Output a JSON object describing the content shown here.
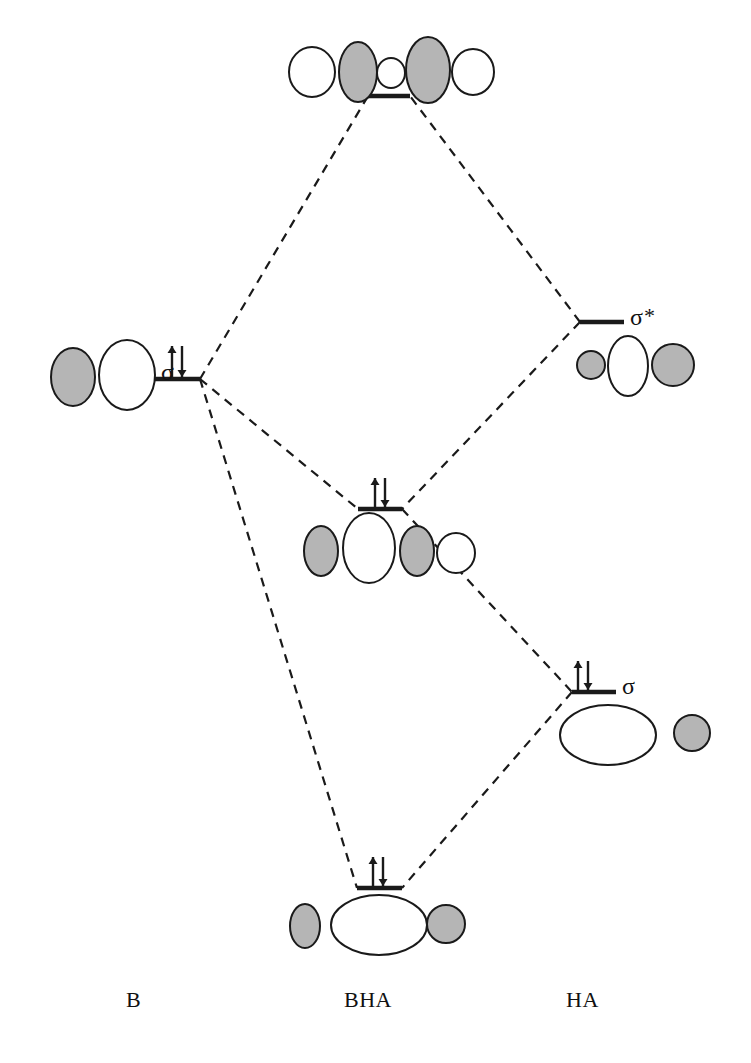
{
  "figure": {
    "kind": "molecular-orbital-correlation-diagram",
    "background_color": "#ffffff",
    "line_color": "#1a1a1a",
    "lobe_fill_shaded": "#b5b5b5",
    "lobe_fill_empty": "#ffffff",
    "width": 751,
    "height": 1063
  },
  "column_labels": {
    "left": "B",
    "center": "BHA",
    "right": "HA"
  },
  "orbital_labels": {
    "left_sigma": "σ",
    "right_sigma_star": "σ",
    "right_sigma_star_superscript": "*",
    "right_sigma": "σ"
  },
  "electron_arrow": {
    "up_glyph": "↑",
    "down_glyph": "↓",
    "pair_glyph": "⇅"
  },
  "levels": [
    {
      "id": "bha-antibonding",
      "column": "center",
      "label": "",
      "electrons": 0,
      "energy_y": 96,
      "bar_x1": 368,
      "bar_x2": 410,
      "orbital_set": "antibonding-top"
    },
    {
      "id": "ha-sigma-star",
      "column": "right",
      "label": "σ*",
      "electrons": 0,
      "energy_y": 322,
      "bar_x1": 580,
      "bar_x2": 624,
      "orbital_set": "sigma-star-right"
    },
    {
      "id": "b-sigma",
      "column": "left",
      "label": "σ",
      "electrons": 2,
      "energy_y": 379,
      "bar_x1": 152,
      "bar_x2": 200,
      "orbital_set": "sigma-left"
    },
    {
      "id": "bha-nonbonding",
      "column": "center",
      "label": "",
      "electrons": 2,
      "energy_y": 509,
      "bar_x1": 358,
      "bar_x2": 402,
      "orbital_set": "nonbonding-middle"
    },
    {
      "id": "ha-sigma",
      "column": "right",
      "label": "σ",
      "electrons": 2,
      "energy_y": 692,
      "bar_x1": 572,
      "bar_x2": 616,
      "orbital_set": "sigma-right"
    },
    {
      "id": "bha-bonding",
      "column": "center",
      "label": "",
      "electrons": 2,
      "energy_y": 888,
      "bar_x1": 357,
      "bar_x2": 402,
      "orbital_set": "bonding-bottom"
    }
  ],
  "correlation_lines": [
    {
      "from": "b-sigma",
      "to": "bha-antibonding"
    },
    {
      "from": "ha-sigma-star",
      "to": "bha-antibonding"
    },
    {
      "from": "b-sigma",
      "to": "bha-nonbonding"
    },
    {
      "from": "ha-sigma-star",
      "to": "bha-nonbonding"
    },
    {
      "from": "b-sigma",
      "to": "bha-bonding"
    },
    {
      "from": "ha-sigma",
      "to": "bha-bonding"
    },
    {
      "from": "bha-nonbonding",
      "to": "ha-sigma"
    }
  ],
  "orbital_sets": {
    "antibonding-top": [
      {
        "shape": "ellipse",
        "cx": 312,
        "cy": 72,
        "rx": 23,
        "ry": 25,
        "fill": "empty"
      },
      {
        "shape": "ellipse",
        "cx": 358,
        "cy": 72,
        "rx": 19,
        "ry": 30,
        "fill": "shaded"
      },
      {
        "shape": "ellipse",
        "cx": 391,
        "cy": 73,
        "rx": 14,
        "ry": 15,
        "fill": "empty"
      },
      {
        "shape": "ellipse",
        "cx": 428,
        "cy": 70,
        "rx": 22,
        "ry": 33,
        "fill": "shaded"
      },
      {
        "shape": "ellipse",
        "cx": 473,
        "cy": 72,
        "rx": 21,
        "ry": 23,
        "fill": "empty"
      }
    ],
    "sigma-star-right": [
      {
        "shape": "ellipse",
        "cx": 591,
        "cy": 365,
        "rx": 14,
        "ry": 14,
        "fill": "shaded"
      },
      {
        "shape": "ellipse",
        "cx": 628,
        "cy": 366,
        "rx": 20,
        "ry": 30,
        "fill": "empty"
      },
      {
        "shape": "ellipse",
        "cx": 673,
        "cy": 365,
        "rx": 21,
        "ry": 21,
        "fill": "shaded"
      }
    ],
    "sigma-left": [
      {
        "shape": "ellipse",
        "cx": 73,
        "cy": 377,
        "rx": 22,
        "ry": 29,
        "fill": "shaded"
      },
      {
        "shape": "ellipse",
        "cx": 127,
        "cy": 375,
        "rx": 28,
        "ry": 35,
        "fill": "empty"
      }
    ],
    "nonbonding-middle": [
      {
        "shape": "ellipse",
        "cx": 321,
        "cy": 551,
        "rx": 17,
        "ry": 25,
        "fill": "shaded"
      },
      {
        "shape": "ellipse",
        "cx": 369,
        "cy": 548,
        "rx": 26,
        "ry": 35,
        "fill": "empty"
      },
      {
        "shape": "ellipse",
        "cx": 417,
        "cy": 551,
        "rx": 17,
        "ry": 25,
        "fill": "shaded"
      },
      {
        "shape": "ellipse",
        "cx": 456,
        "cy": 553,
        "rx": 19,
        "ry": 20,
        "fill": "empty"
      }
    ],
    "sigma-right": [
      {
        "shape": "ellipse",
        "cx": 608,
        "cy": 735,
        "rx": 48,
        "ry": 30,
        "fill": "empty"
      },
      {
        "shape": "ellipse",
        "cx": 692,
        "cy": 733,
        "rx": 18,
        "ry": 18,
        "fill": "shaded"
      }
    ],
    "bonding-bottom": [
      {
        "shape": "ellipse",
        "cx": 305,
        "cy": 926,
        "rx": 15,
        "ry": 22,
        "fill": "shaded"
      },
      {
        "shape": "ellipse",
        "cx": 379,
        "cy": 925,
        "rx": 48,
        "ry": 30,
        "fill": "empty"
      },
      {
        "shape": "ellipse",
        "cx": 446,
        "cy": 924,
        "rx": 19,
        "ry": 19,
        "fill": "shaded"
      }
    ]
  },
  "arrow_groups": [
    {
      "level": "b-sigma",
      "x": 177,
      "y_top": 346,
      "y_bottom": 377
    },
    {
      "level": "bha-nonbonding",
      "x": 380,
      "y_top": 478,
      "y_bottom": 507
    },
    {
      "level": "ha-sigma",
      "x": 583,
      "y_top": 661,
      "y_bottom": 690
    },
    {
      "level": "bha-bonding",
      "x": 378,
      "y_top": 857,
      "y_bottom": 886
    }
  ]
}
